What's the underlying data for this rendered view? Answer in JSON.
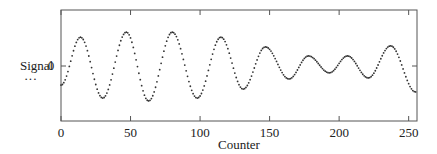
{
  "chart_data": {
    "type": "scatter",
    "title": "",
    "xlabel": "Counter",
    "ylabel": "Signal",
    "legend": [
      {
        "label": "Signal",
        "marker": "dotted"
      }
    ],
    "xlim": [
      0,
      256
    ],
    "xticks": [
      0,
      50,
      100,
      150,
      200,
      250
    ],
    "yticks": [
      0
    ],
    "ytick_labels": [
      "0"
    ],
    "grid": false,
    "key_points": [
      {
        "x": 0,
        "y": -0.53
      },
      {
        "x": 14,
        "y": 0.8
      },
      {
        "x": 30,
        "y": -0.89
      },
      {
        "x": 47,
        "y": 0.94
      },
      {
        "x": 63,
        "y": -0.97
      },
      {
        "x": 80,
        "y": 0.94
      },
      {
        "x": 98,
        "y": -0.89
      },
      {
        "x": 115,
        "y": 0.8
      },
      {
        "x": 131,
        "y": -0.64
      },
      {
        "x": 147,
        "y": 0.53
      },
      {
        "x": 164,
        "y": -0.36
      },
      {
        "x": 178,
        "y": 0.28
      },
      {
        "x": 193,
        "y": -0.19
      },
      {
        "x": 206,
        "y": 0.28
      },
      {
        "x": 221,
        "y": -0.33
      },
      {
        "x": 237,
        "y": 0.56
      },
      {
        "x": 255,
        "y": -0.72
      }
    ]
  },
  "labels": {
    "ylabel": "Signal",
    "legend_marker": "···",
    "xlabel": "Counter",
    "ytick0": "0",
    "xticks": [
      "0",
      "50",
      "100",
      "150",
      "200",
      "250"
    ]
  }
}
